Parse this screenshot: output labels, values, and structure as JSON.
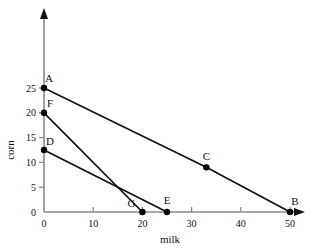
{
  "chart_data": {
    "type": "line",
    "title": "",
    "xlabel": "milk",
    "ylabel": "corn",
    "xlim": [
      0,
      53
    ],
    "ylim": [
      0,
      29
    ],
    "xticks": [
      0,
      10,
      20,
      30,
      40,
      50
    ],
    "yticks": [
      0,
      5,
      10,
      15,
      20,
      25
    ],
    "xtick_labels": [
      "0",
      "10",
      "20",
      "30",
      "40",
      "50"
    ],
    "ytick_labels": [
      "0",
      "5",
      "10",
      "15",
      "20",
      "25"
    ],
    "grid": false,
    "legend": "none",
    "axis_arrows": true,
    "series": [
      {
        "name": "AB",
        "label": "A-B budget line",
        "points": [
          {
            "label": "A",
            "x": 0,
            "y": 25,
            "marker": true
          },
          {
            "label": "C",
            "x": 33,
            "y": 9,
            "marker": true
          },
          {
            "label": "B",
            "x": 50,
            "y": 0,
            "marker": true
          }
        ]
      },
      {
        "name": "FG",
        "label": "F-G budget line",
        "points": [
          {
            "label": "F",
            "x": 0,
            "y": 20,
            "marker": true
          },
          {
            "label": "G",
            "x": 20,
            "y": 0,
            "marker": true
          }
        ]
      },
      {
        "name": "DE",
        "label": "D-E budget line",
        "points": [
          {
            "label": "D",
            "x": 0,
            "y": 12.5,
            "marker": true
          },
          {
            "label": "E",
            "x": 25,
            "y": 0,
            "marker": true
          }
        ]
      }
    ],
    "point_labels": [
      "A",
      "B",
      "C",
      "D",
      "E",
      "F",
      "G"
    ],
    "colors": {
      "line": "#111111",
      "marker": "#000000",
      "axis": "#7a7a7a",
      "background": "#ffffff"
    }
  }
}
